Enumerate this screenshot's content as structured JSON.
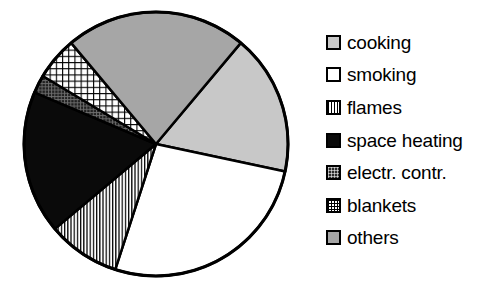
{
  "chart_data": {
    "type": "pie",
    "title": "",
    "subtitle": "",
    "xlabel": "",
    "ylabel": "",
    "grid": false,
    "legend_position": "right",
    "center": {
      "x": 156,
      "y": 144
    },
    "radius": 132,
    "start_angle_deg": 12,
    "direction": "clockwise",
    "categories": [
      "cooking",
      "smoking",
      "flames",
      "space heating",
      "electr. contr.",
      "blankets",
      "others"
    ],
    "values": [
      17,
      27,
      9,
      17,
      2,
      5,
      23
    ],
    "slices": [
      {
        "label": "cooking",
        "value": 17,
        "fill": "light-gray",
        "color": "#c8c8c8",
        "start_deg": 310,
        "end_deg": 372
      },
      {
        "label": "smoking",
        "value": 27,
        "fill": "white",
        "color": "#ffffff",
        "start_deg": 12,
        "end_deg": 108
      },
      {
        "label": "flames",
        "value": 9,
        "fill": "v-stripes",
        "color": "#ffffff",
        "start_deg": 108,
        "end_deg": 140
      },
      {
        "label": "space heating",
        "value": 17,
        "fill": "black",
        "color": "#0a0a0a",
        "start_deg": 140,
        "end_deg": 203
      },
      {
        "label": "electr. contr.",
        "value": 2,
        "fill": "dark-crosshatch",
        "color": "#2b2b2b",
        "start_deg": 203,
        "end_deg": 211
      },
      {
        "label": "blankets",
        "value": 5,
        "fill": "light-crosshatch",
        "color": "#ffffff",
        "start_deg": 211,
        "end_deg": 230
      },
      {
        "label": "others",
        "value": 23,
        "fill": "gray",
        "color": "#a6a6a6",
        "start_deg": 230,
        "end_deg": 310
      }
    ],
    "stroke_color": "#000000",
    "stroke_width": 2.5
  },
  "legend": {
    "items": [
      {
        "label": "cooking",
        "fill": "light-gray"
      },
      {
        "label": "smoking",
        "fill": "white"
      },
      {
        "label": "flames",
        "fill": "v-stripes"
      },
      {
        "label": "space heating",
        "fill": "black"
      },
      {
        "label": "electr. contr.",
        "fill": "dark-crosshatch"
      },
      {
        "label": "blankets",
        "fill": "light-crosshatch"
      },
      {
        "label": "others",
        "fill": "gray"
      }
    ]
  }
}
